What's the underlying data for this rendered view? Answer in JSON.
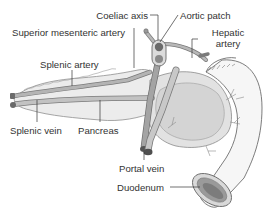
{
  "diagram": {
    "type": "anatomical illustration",
    "colors": {
      "background": "#ffffff",
      "organ_fill": "#ebebeb",
      "organ_stroke": "#8a8a8a",
      "vessel_fill": "#a8a8a8",
      "vessel_dark": "#6f6f6f",
      "leader_line": "#333333",
      "label_text": "#333333"
    },
    "labels": {
      "coeliac_axis": "Coeliac axis",
      "aortic_patch": "Aortic patch",
      "superior_mesenteric_artery": "Superior mesenteric artery",
      "hepatic_artery_line1": "Hepatic",
      "hepatic_artery_line2": "artery",
      "splenic_artery": "Splenic artery",
      "splenic_vein": "Splenic vein",
      "pancreas": "Pancreas",
      "portal_vein": "Portal vein",
      "duodenum": "Duodenum"
    },
    "structures": [
      "pancreas",
      "duodenum",
      "aortic-patch",
      "coeliac-axis",
      "superior-mesenteric-artery",
      "splenic-artery",
      "splenic-vein",
      "hepatic-artery",
      "portal-vein"
    ]
  }
}
